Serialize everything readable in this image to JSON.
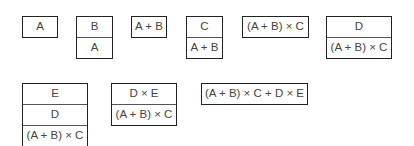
{
  "stacks": [
    {
      "cells": [
        "A"
      ]
    },
    {
      "cells": [
        "B",
        "A"
      ]
    },
    {
      "cells": [
        "A + B"
      ]
    },
    {
      "cells": [
        "C",
        "A + B"
      ]
    },
    {
      "cells": [
        "(A + B) × C"
      ]
    },
    {
      "cells": [
        "D",
        "(A + B) × C"
      ]
    },
    {
      "cells": [
        "E",
        "D",
        "(A + B) × C"
      ]
    },
    {
      "cells": [
        "D × E",
        "(A + B) × C"
      ]
    },
    {
      "cells": [
        "(A + B) × C + D × E"
      ]
    }
  ]
}
